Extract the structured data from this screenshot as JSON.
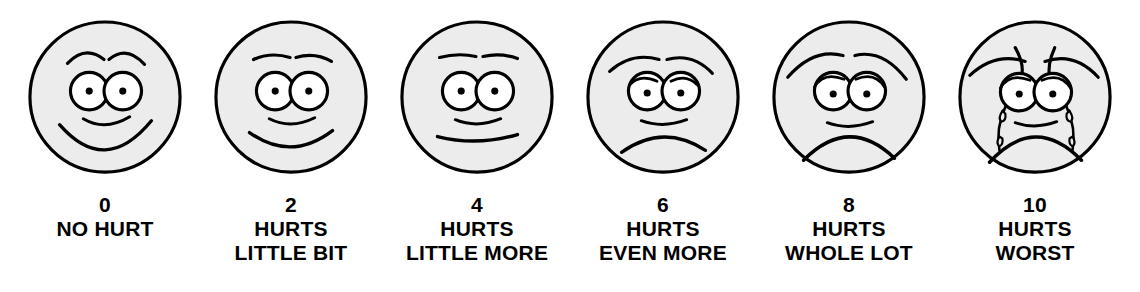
{
  "colors": {
    "face_fill": "#ececec",
    "stroke": "#000000",
    "background": "#ffffff",
    "eye_white": "#ffffff",
    "pupil": "#000000"
  },
  "faces": [
    {
      "score": "0",
      "line1": "NO HURT",
      "line2": "",
      "expression": "happy-big-smile",
      "icon": "face-no-hurt-icon"
    },
    {
      "score": "2",
      "line1": "HURTS",
      "line2": "LITTLE BIT",
      "expression": "slight-smile",
      "icon": "face-hurts-little-bit-icon"
    },
    {
      "score": "4",
      "line1": "HURTS",
      "line2": "LITTLE MORE",
      "expression": "neutral-flat-mouth",
      "icon": "face-hurts-little-more-icon"
    },
    {
      "score": "6",
      "line1": "HURTS",
      "line2": "EVEN MORE",
      "expression": "frown-worried",
      "icon": "face-hurts-even-more-icon"
    },
    {
      "score": "8",
      "line1": "HURTS",
      "line2": "WHOLE LOT",
      "expression": "deep-frown-droopy-eyes",
      "icon": "face-hurts-whole-lot-icon"
    },
    {
      "score": "10",
      "line1": "HURTS",
      "line2": "WORST",
      "expression": "crying-with-tears",
      "icon": "face-hurts-worst-icon"
    }
  ]
}
